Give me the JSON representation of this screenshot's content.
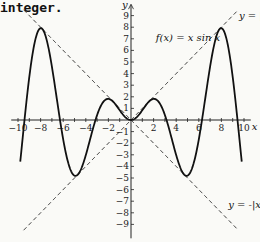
{
  "caption": "integer.",
  "chart_data": {
    "type": "line",
    "title": "",
    "xlabel": "x",
    "ylabel": "y",
    "xlim": [
      -10.5,
      10.5
    ],
    "ylim": [
      -9.5,
      9.5
    ],
    "x_ticks": [
      -10,
      -8,
      -6,
      -4,
      -2,
      2,
      4,
      6,
      8,
      10
    ],
    "y_ticks": [
      -9,
      -8,
      -7,
      -6,
      -5,
      -4,
      -3,
      -2,
      -1,
      1,
      2,
      3,
      4,
      5,
      6,
      7,
      8,
      9
    ],
    "grid": false,
    "series": [
      {
        "name": "f(x) = x sin x",
        "style": "solid",
        "function": "x*sin(x)",
        "domain": [
          -9.8,
          9.8
        ]
      },
      {
        "name": "y = |x|",
        "style": "dashed",
        "function": "abs(x)",
        "domain": [
          -9.5,
          9.5
        ]
      },
      {
        "name": "y = -|x|",
        "style": "dashed",
        "function": "-abs(x)",
        "domain": [
          -9.5,
          9.5
        ]
      }
    ],
    "annotations": [
      {
        "text": "f(x) = x sin x",
        "x": 2.2,
        "y": 7
      },
      {
        "text": "y = |x|",
        "x": 9.6,
        "y": 9
      },
      {
        "text": "y = -|x|",
        "x": 8.7,
        "y": -7.8
      }
    ]
  },
  "labels": {
    "f": "f(x) = x sin x",
    "abs": "y = |x|",
    "negabs": "y = -|x",
    "x_axis": "x",
    "y_axis": "y"
  }
}
